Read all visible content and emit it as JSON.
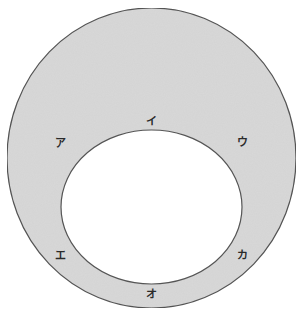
{
  "diagram": {
    "colors": {
      "ring_fill": "#d9d9d9",
      "outline": "#555555",
      "inner_fill": "#ffffff",
      "label": "#2a2a2a"
    },
    "outer_shape": {
      "cx": 151.5,
      "cy": 158,
      "rx": 144.5,
      "ry": 150
    },
    "inner_shape": {
      "cx": 151.5,
      "cy": 207,
      "rx": 90.5,
      "ry": 77
    },
    "labels": [
      {
        "text": "ア",
        "x": 60,
        "y": 144
      },
      {
        "text": "イ",
        "x": 151,
        "y": 122
      },
      {
        "text": "ウ",
        "x": 242,
        "y": 143
      },
      {
        "text": "エ",
        "x": 60,
        "y": 256
      },
      {
        "text": "オ",
        "x": 151,
        "y": 295
      },
      {
        "text": "カ",
        "x": 242,
        "y": 256
      }
    ]
  }
}
